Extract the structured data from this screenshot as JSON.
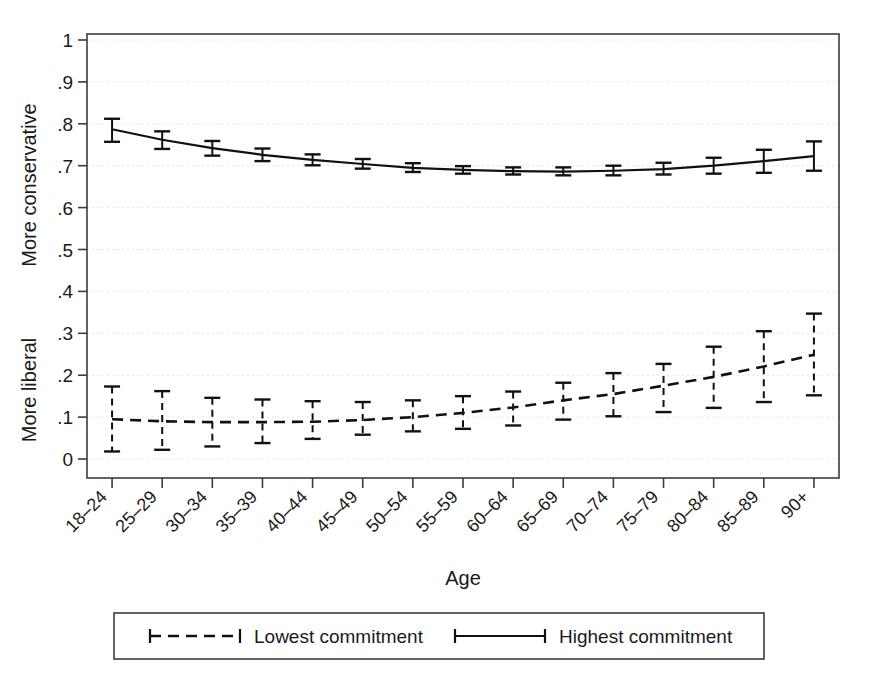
{
  "chart_data": {
    "type": "line",
    "title": "",
    "xlabel": "Age",
    "ylabel_upper": "More conservative",
    "ylabel_lower": "More liberal",
    "ylim": [
      0,
      1
    ],
    "yticks": [
      "0",
      ".1",
      ".2",
      ".3",
      ".4",
      ".5",
      ".6",
      ".7",
      ".8",
      ".9",
      "1"
    ],
    "ytick_values": [
      0,
      0.1,
      0.2,
      0.3,
      0.4,
      0.5,
      0.6,
      0.7,
      0.8,
      0.9,
      1.0
    ],
    "grid": true,
    "legend_position": "bottom",
    "categories": [
      "18–24",
      "25–29",
      "30–34",
      "35–39",
      "40–44",
      "45–49",
      "50–54",
      "55–59",
      "60–64",
      "65–69",
      "70–74",
      "75–79",
      "80–84",
      "85–89",
      "90+"
    ],
    "series": [
      {
        "name": "Highest commitment",
        "style": "solid",
        "values": [
          0.787,
          0.762,
          0.742,
          0.726,
          0.714,
          0.704,
          0.695,
          0.69,
          0.687,
          0.686,
          0.688,
          0.692,
          0.7,
          0.711,
          0.723
        ],
        "ci_low": [
          0.757,
          0.74,
          0.724,
          0.711,
          0.701,
          0.693,
          0.685,
          0.681,
          0.679,
          0.677,
          0.677,
          0.679,
          0.681,
          0.683,
          0.688
        ],
        "ci_high": [
          0.812,
          0.782,
          0.759,
          0.741,
          0.727,
          0.716,
          0.706,
          0.699,
          0.696,
          0.696,
          0.7,
          0.707,
          0.719,
          0.738,
          0.758
        ]
      },
      {
        "name": "Lowest commitment",
        "style": "dashed",
        "values": [
          0.095,
          0.09,
          0.088,
          0.088,
          0.089,
          0.093,
          0.1,
          0.11,
          0.123,
          0.14,
          0.155,
          0.175,
          0.196,
          0.221,
          0.249
        ],
        "ci_low": [
          0.018,
          0.022,
          0.03,
          0.038,
          0.048,
          0.058,
          0.066,
          0.072,
          0.08,
          0.094,
          0.102,
          0.112,
          0.122,
          0.136,
          0.152
        ],
        "ci_high": [
          0.173,
          0.162,
          0.146,
          0.142,
          0.138,
          0.136,
          0.14,
          0.15,
          0.161,
          0.182,
          0.205,
          0.227,
          0.268,
          0.305,
          0.347
        ]
      }
    ],
    "legend": [
      {
        "label": "Lowest commitment",
        "style": "dashed"
      },
      {
        "label": "Highest commitment",
        "style": "solid"
      }
    ]
  },
  "colors": {
    "line": "#111111",
    "frame": "#3c3c3c",
    "grid": "#e3e3e3",
    "background": "#ffffff"
  }
}
